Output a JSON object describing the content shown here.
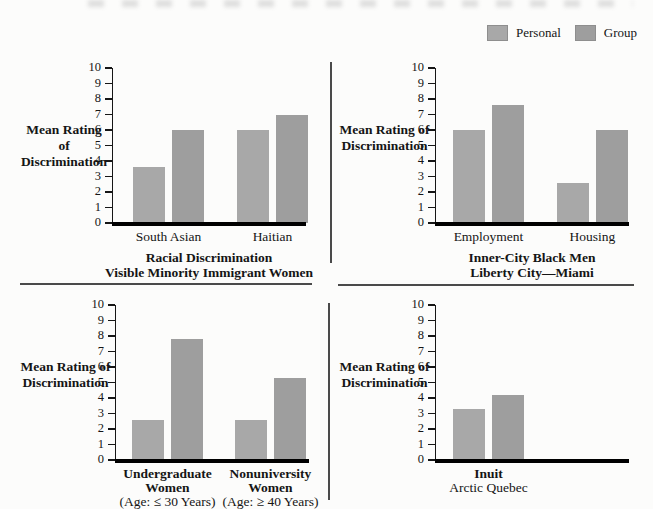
{
  "legend": {
    "personal_label": "Personal",
    "group_label": "Group"
  },
  "colors": {
    "personal": "#a8a8a8",
    "group": "#9e9e9e",
    "axis": "#161616",
    "baseline": "#000000",
    "divider": "#4a4a4a"
  },
  "chart_data": [
    {
      "type": "bar",
      "title": "Racial Discrimination — Visible Minority Immigrant Women",
      "title_lines": [
        "Racial Discrimination",
        "Visible Minority Immigrant Women"
      ],
      "ylabel": "Mean Rating of Discrimination",
      "ylabel_lines": [
        "Mean Rating of",
        "Discrimination"
      ],
      "ylim": [
        0,
        10
      ],
      "ytick_step": 1,
      "categories": [
        [
          "South Asian"
        ],
        [
          "Haitian"
        ]
      ],
      "categories_bold": false,
      "category_sublabels": [
        "",
        ""
      ],
      "series": [
        {
          "name": "Personal",
          "values": [
            3.6,
            6.0
          ]
        },
        {
          "name": "Group",
          "values": [
            6.0,
            7.0
          ]
        }
      ]
    },
    {
      "type": "bar",
      "title": "Inner-City Black Men — Liberty City—Miami",
      "title_lines": [
        "Inner-City Black Men",
        "Liberty City—Miami"
      ],
      "ylabel": "Mean Rating of Discrimination",
      "ylabel_lines": [
        "Mean Rating of",
        "Discrimination"
      ],
      "ylim": [
        0,
        10
      ],
      "ytick_step": 1,
      "categories": [
        [
          "Employment"
        ],
        [
          "Housing"
        ]
      ],
      "categories_bold": false,
      "category_sublabels": [
        "",
        ""
      ],
      "series": [
        {
          "name": "Personal",
          "values": [
            6.0,
            2.6
          ]
        },
        {
          "name": "Group",
          "values": [
            7.6,
            6.0
          ]
        }
      ]
    },
    {
      "type": "bar",
      "title": "",
      "title_lines": [],
      "ylabel": "Mean Rating of Discrimination",
      "ylabel_lines": [
        "Mean Rating of",
        "Discrimination"
      ],
      "ylim": [
        0,
        10
      ],
      "ytick_step": 1,
      "categories": [
        [
          "Undergraduate",
          "Women"
        ],
        [
          "Nonuniversity",
          "Women"
        ]
      ],
      "categories_bold": true,
      "category_sublabels": [
        "(Age: ≤ 30 Years)",
        "(Age: ≥ 40 Years)"
      ],
      "series": [
        {
          "name": "Personal",
          "values": [
            2.6,
            2.6
          ]
        },
        {
          "name": "Group",
          "values": [
            7.8,
            5.3
          ]
        }
      ]
    },
    {
      "type": "bar",
      "title": "",
      "title_lines": [],
      "ylabel": "Mean Rating of Discrimination",
      "ylabel_lines": [
        "Mean Rating of",
        "Discrimination"
      ],
      "ylim": [
        0,
        10
      ],
      "ytick_step": 1,
      "categories": [
        [
          "Inuit"
        ]
      ],
      "categories_bold": true,
      "category_sublabels": [
        "Arctic Quebec"
      ],
      "series": [
        {
          "name": "Personal",
          "values": [
            3.3
          ]
        },
        {
          "name": "Group",
          "values": [
            4.2
          ]
        }
      ]
    }
  ]
}
